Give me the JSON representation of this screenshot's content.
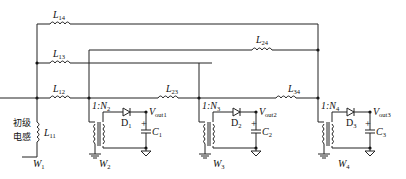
{
  "diagram": {
    "title": "",
    "primary_label": [
      "初级",
      "电感"
    ],
    "inductors": {
      "L14": {
        "base": "L",
        "sub": "14"
      },
      "L13": {
        "base": "L",
        "sub": "13"
      },
      "L12": {
        "base": "L",
        "sub": "12"
      },
      "L11": {
        "base": "L",
        "sub": "11"
      },
      "L24": {
        "base": "L",
        "sub": "24"
      },
      "L23": {
        "base": "L",
        "sub": "23"
      },
      "L34": {
        "base": "L",
        "sub": "34"
      }
    },
    "windings": [
      {
        "base": "W",
        "sub": "1"
      },
      {
        "base": "W",
        "sub": "2"
      },
      {
        "base": "W",
        "sub": "3"
      },
      {
        "base": "W",
        "sub": "4"
      }
    ],
    "transformers": [
      {
        "ratio_prefix": "1:",
        "base": "N",
        "sub": "2"
      },
      {
        "ratio_prefix": "1:",
        "base": "N",
        "sub": "3"
      },
      {
        "ratio_prefix": "1:",
        "base": "N",
        "sub": "4"
      }
    ],
    "diodes": [
      {
        "base": "D",
        "sub": "1"
      },
      {
        "base": "D",
        "sub": "2"
      },
      {
        "base": "D",
        "sub": "3"
      }
    ],
    "capacitors": [
      {
        "base": "C",
        "sub": "1",
        "polarity": "+"
      },
      {
        "base": "C",
        "sub": "2",
        "polarity": "+"
      },
      {
        "base": "C",
        "sub": "3",
        "polarity": "+"
      }
    ],
    "outputs": [
      {
        "base": "V",
        "sub": "out1"
      },
      {
        "base": "V",
        "sub": "out2"
      },
      {
        "base": "V",
        "sub": "out3"
      }
    ]
  }
}
